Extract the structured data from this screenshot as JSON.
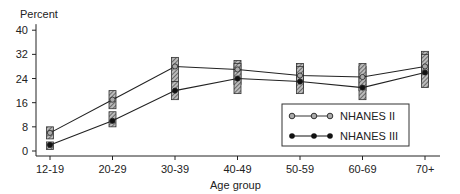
{
  "chart_data": {
    "type": "line",
    "title": "",
    "ylabel": "Percent",
    "xlabel": "Age group",
    "ylim": [
      0,
      40
    ],
    "yticks": [
      0,
      8,
      16,
      24,
      32,
      40
    ],
    "categories": [
      "12-19",
      "20-29",
      "30-39",
      "40-49",
      "50-59",
      "60-69",
      "70+"
    ],
    "series": [
      {
        "name": "NHANES II",
        "marker": "open-circle",
        "values": [
          6,
          17,
          28,
          27,
          25,
          24.5,
          28
        ],
        "ci_low": [
          4,
          14,
          23,
          22,
          21,
          20,
          23
        ],
        "ci_high": [
          8,
          20,
          31,
          30,
          29,
          28,
          33
        ]
      },
      {
        "name": "NHANES III",
        "marker": "filled-circle",
        "values": [
          2,
          10,
          20,
          24,
          23,
          21,
          26
        ],
        "ci_low": [
          0.5,
          8,
          17,
          19,
          19,
          17,
          21
        ],
        "ci_high": [
          3,
          13,
          23,
          29,
          28,
          29,
          32
        ]
      }
    ],
    "legend_position": "lower-right",
    "grid": false
  }
}
